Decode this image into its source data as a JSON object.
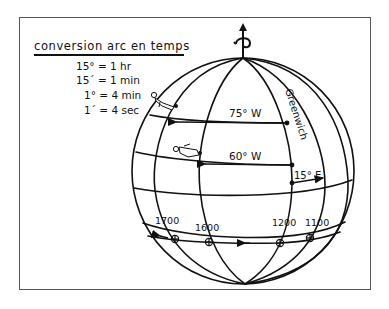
{
  "panel": {
    "title": "conversion arc en temps",
    "conversions": [
      "15° = 1 hr",
      "15´ = 1 min",
      "1° = 4 min",
      "1´ = 4 sec"
    ]
  },
  "globe": {
    "meridian_label": "Greenwich",
    "arc_labels": {
      "upper": "75° W",
      "middle": "60° W",
      "east": "15° E"
    },
    "time_labels": [
      "1700",
      "1600",
      "1200",
      "1100"
    ],
    "axis_icon": "rotation-axis-arrow-icon",
    "figures": [
      "standing-person-icon",
      "lying-person-icon"
    ]
  },
  "colors": {
    "ink": "#111111",
    "frame": "#555555",
    "background": "#ffffff"
  }
}
